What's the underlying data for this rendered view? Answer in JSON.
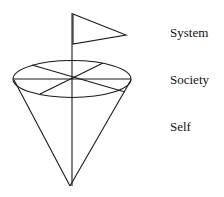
{
  "diagram": {
    "type": "cone-with-flag",
    "labels": [
      {
        "id": "system",
        "text": "System"
      },
      {
        "id": "society",
        "text": "Society"
      },
      {
        "id": "self",
        "text": "Self"
      }
    ],
    "colors": {
      "stroke": "#1a1a1a",
      "background": "#ffffff",
      "text": "#111111"
    }
  }
}
